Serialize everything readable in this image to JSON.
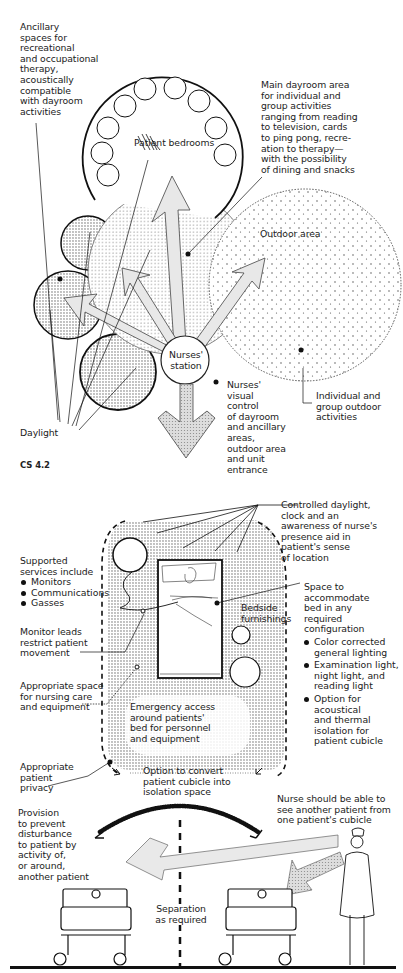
{
  "figure_top": {
    "caption": "CS 4.2",
    "labels": {
      "ancillary": "Ancillary\nspaces for\nrecreational\nand occupational\ntherapy,\nacoustically\ncompatible\nwith dayroom\nactivities",
      "patient_bedrooms": "Patient bedrooms",
      "main_dayroom": "Main dayroom area\nfor individual and\ngroup activities\nranging from reading\nto television, cards\nto ping pong, recre-\nation to therapy—\nwith the possibility\nof dining and snacks",
      "outdoor_area": "Outdoor area",
      "nurses_station": "Nurses'\nstation",
      "nurses_visual_control": "Nurses'\nvisual\ncontrol\nof dayroom\nand ancillary\nareas,\noutdoor area\nand unit\nentrance",
      "outdoor_activities": "Individual and\ngroup outdoor\nactivities",
      "daylight": "Daylight"
    }
  },
  "figure_bottom": {
    "labels": {
      "controlled_daylight": "Controlled daylight,\nclock and an\nawareness of nurse's\npresence aid in\npatient's sense\nof location",
      "supported_services_title": "Supported\nservices include",
      "supported_services": [
        "Monitors",
        "Communications",
        "Gasses"
      ],
      "space_to_accommodate": "Space to\naccommodate\nbed in any\nrequired\nconfiguration",
      "space_bullets": [
        "Color corrected\ngeneral lighting",
        "Examination light,\nnight light, and\nreading light",
        "Option for\nacoustical\nand thermal\nisolation for\npatient cubicle"
      ],
      "bedside_furnishings": "Bedside\nfurnishings",
      "monitor_leads": "Monitor leads\nrestrict patient\nmovement",
      "appropriate_space": "Appropriate space\nfor nursing care\nand equipment",
      "emergency_access": "Emergency access\naround patients'\nbed for personnel\nand equipment",
      "appropriate_privacy": "Appropriate\npatient\nprivacy",
      "option_convert": "Option to convert\npatient cubicle into\nisolation space",
      "nurse_see": "Nurse should be able to\nsee another patient from\none patient's cubicle",
      "provision": "Provision\nto prevent\ndisturbance\nto patient by\nactivity of,\nor around,\nanother patient",
      "separation": "Separation\nas required"
    }
  },
  "colors": {
    "ink": "#111111",
    "stipple": "#9a9a9a",
    "arrow_fill": "#e6e6e6",
    "background": "#ffffff"
  }
}
